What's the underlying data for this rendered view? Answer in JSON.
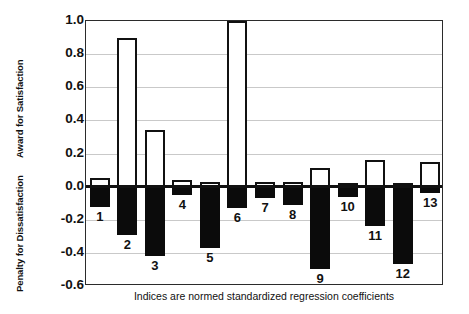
{
  "chart_data": {
    "type": "bar",
    "title": "",
    "subtitle": "",
    "xlabel": "Indices are normed standardized regression coefficients",
    "ylabel_upper": "Award for Satisfaction",
    "ylabel_lower": "Penalty for Dissatisfaction",
    "ylim": [
      -0.6,
      1.0
    ],
    "ytick_labels": [
      "1.0",
      "0.8",
      "0.6",
      "0.4",
      "0.2",
      "0.0",
      "-0.2",
      "-0.4",
      "-0.6"
    ],
    "ytick_values": [
      1.0,
      0.8,
      0.6,
      0.4,
      0.2,
      0.0,
      -0.2,
      -0.4,
      -0.6
    ],
    "grid": true,
    "legend": "none",
    "categories": [
      "1",
      "2",
      "3",
      "4",
      "5",
      "6",
      "7",
      "8",
      "9",
      "10",
      "11",
      "12",
      "13"
    ],
    "series": [
      {
        "name": "Award for Satisfaction",
        "style": "white-filled-black-outline",
        "values": [
          0.05,
          0.9,
          0.34,
          0.04,
          0.03,
          1.0,
          0.03,
          0.03,
          0.11,
          0.02,
          0.16,
          0.02,
          0.15
        ]
      },
      {
        "name": "Penalty for Dissatisfaction",
        "style": "black-filled",
        "values": [
          -0.12,
          -0.29,
          -0.42,
          -0.05,
          -0.37,
          -0.13,
          -0.07,
          -0.11,
          -0.5,
          -0.06,
          -0.24,
          -0.47,
          -0.04
        ]
      }
    ],
    "label_offsets": [
      0.0,
      0.0,
      0.0,
      0.0,
      0.0,
      0.0,
      0.0,
      0.0,
      0.0,
      0.0,
      0.0,
      0.0,
      0.0
    ],
    "colors": {
      "award_fill": "#ffffff",
      "award_stroke": "#111111",
      "penalty_fill": "#0b0b0b",
      "gridline": "#c9c9c9",
      "axis": "#2b2b2b",
      "text": "#111111",
      "background": "#ffffff"
    }
  }
}
